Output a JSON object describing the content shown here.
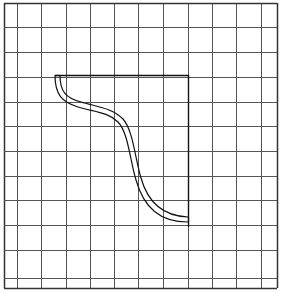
{
  "diagram": {
    "type": "grid-with-shape",
    "background": "#ffffff",
    "grid": {
      "line_color": "#555555",
      "border_color": "#333333",
      "vertical_lines_x": [
        4,
        17,
        41,
        66,
        90,
        114,
        138,
        163,
        188,
        212,
        236,
        261,
        277
      ],
      "horizontal_lines_y": [
        3,
        27,
        52,
        77,
        102,
        126,
        151,
        176,
        200,
        225,
        250,
        278,
        288
      ]
    },
    "shape": {
      "description": "Quarter-region bounded by a straight top edge, a straight right edge, and a double-line S-shaped curve",
      "stroke_color": "#111111",
      "top_edge": {
        "x1": 55,
        "y1": 75,
        "x2": 188,
        "y2": 75
      },
      "right_edge": {
        "x1": 188,
        "y1": 75,
        "x2": 188,
        "y2": 227
      },
      "curve_outer": "M55,75 C55,95 62,102 78,107 C95,112 108,112 118,122 C128,132 130,160 136,180 C144,208 160,222 188,222",
      "curve_inner": "M60,75 C60,92 66,98 81,102 C98,107 112,108 123,119 C133,130 135,158 141,178 C148,203 163,216 188,217"
    }
  }
}
